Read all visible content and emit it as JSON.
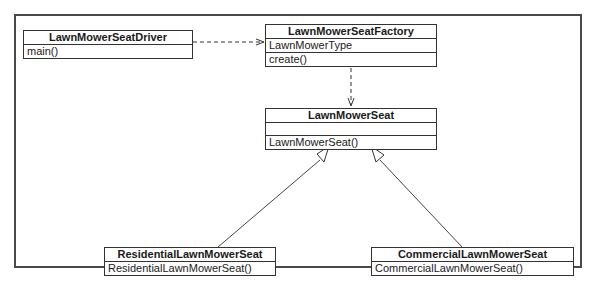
{
  "diagram": {
    "type": "UML class diagram",
    "classes": {
      "driver": {
        "name": "LawnMowerSeatDriver",
        "attributes": [],
        "operations": [
          "main()"
        ]
      },
      "factory": {
        "name": "LawnMowerSeatFactory",
        "attributes": [
          "LawnMowerType"
        ],
        "operations": [
          "create()"
        ]
      },
      "seat": {
        "name": "LawnMowerSeat",
        "attributes": [],
        "operations": [
          "LawnMowerSeat()"
        ]
      },
      "residential": {
        "name": "ResidentialLawnMowerSeat",
        "attributes": [],
        "operations": [
          "ResidentialLawnMowerSeat()"
        ]
      },
      "commercial": {
        "name": "CommercialLawnMowerSeat",
        "attributes": [],
        "operations": [
          "CommercialLawnMowerSeat()"
        ]
      }
    },
    "relationships": [
      {
        "from": "LawnMowerSeatDriver",
        "to": "LawnMowerSeatFactory",
        "kind": "dependency"
      },
      {
        "from": "LawnMowerSeatFactory",
        "to": "LawnMowerSeat",
        "kind": "dependency"
      },
      {
        "from": "ResidentialLawnMowerSeat",
        "to": "LawnMowerSeat",
        "kind": "generalization"
      },
      {
        "from": "CommercialLawnMowerSeat",
        "to": "LawnMowerSeat",
        "kind": "generalization"
      }
    ]
  }
}
